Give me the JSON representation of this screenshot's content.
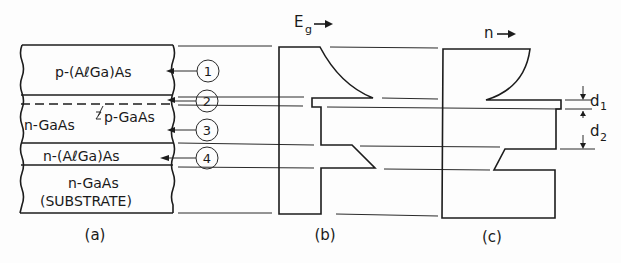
{
  "figure": {
    "panels": [
      {
        "id": "a",
        "caption": "(a)"
      },
      {
        "id": "b",
        "caption": "(b)",
        "axis_label": "E",
        "axis_subscript": "g",
        "arrow": "→"
      },
      {
        "id": "c",
        "caption": "(c)",
        "axis_label": "n",
        "arrow": "→"
      }
    ],
    "layers": [
      {
        "label": "p-(AℓGa)As",
        "marker": "1"
      },
      {
        "label": "p-GaAs",
        "marker": "2"
      },
      {
        "label": "n-GaAs",
        "marker": "3"
      },
      {
        "label": "n-(AℓGa)As",
        "marker": "4"
      },
      {
        "label": "n-GaAs",
        "sublabel": "(SUBSTRATE)"
      }
    ],
    "dimensions": {
      "d1_main": "d",
      "d1_sub": "1",
      "d2_main": "d",
      "d2_sub": "2"
    }
  }
}
